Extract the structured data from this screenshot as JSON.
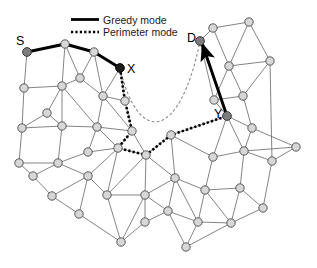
{
  "figure": {
    "background": "#ffffff"
  },
  "legend": {
    "position": "top-center",
    "items": [
      {
        "label": "Greedy mode",
        "style": "solid",
        "swatch": "greedy-line-swatch",
        "color": "#000000",
        "width": 2.8
      },
      {
        "label": "Perimeter mode",
        "style": "dotted",
        "swatch": "perimeter-line-swatch",
        "color": "#000000",
        "width": 2.6
      }
    ]
  },
  "labels": {
    "source": "S",
    "destination": "D",
    "perimeter_entry": "X",
    "perimeter_exit": "Y"
  },
  "colors": {
    "node_fill": "#d7d7d7",
    "node_stroke": "#4a4a4a",
    "marked_node_fill": "#7d7d7d",
    "dark_node_fill": "#1c1c1c",
    "edge": "#6e6e6e",
    "greedy": "#000000",
    "perimeter": "#000000",
    "xd_line": "#8a8a8a"
  },
  "graph": {
    "node_radius": 4.2,
    "marked_node_radius": 4.4,
    "nodes": [
      {
        "id": "n0",
        "x": 27,
        "y": 52,
        "role": "source",
        "label": "S"
      },
      {
        "id": "n1",
        "x": 65,
        "y": 44,
        "role": "plain"
      },
      {
        "id": "n2",
        "x": 94,
        "y": 52,
        "role": "plain"
      },
      {
        "id": "n3",
        "x": 120,
        "y": 68,
        "role": "perimeter-entry",
        "label": "X"
      },
      {
        "id": "n4",
        "x": 200,
        "y": 41,
        "role": "destination",
        "label": "D"
      },
      {
        "id": "n5",
        "x": 227,
        "y": 116,
        "role": "perimeter-exit",
        "label": "Y"
      },
      {
        "id": "n6",
        "x": 24,
        "y": 88,
        "role": "plain"
      },
      {
        "id": "n7",
        "x": 62,
        "y": 86,
        "role": "plain"
      },
      {
        "id": "n8",
        "x": 80,
        "y": 78,
        "role": "plain"
      },
      {
        "id": "n9",
        "x": 103,
        "y": 96,
        "role": "plain"
      },
      {
        "id": "n10",
        "x": 125,
        "y": 101,
        "role": "plain"
      },
      {
        "id": "n11",
        "x": 47,
        "y": 113,
        "role": "plain"
      },
      {
        "id": "n12",
        "x": 22,
        "y": 128,
        "role": "plain"
      },
      {
        "id": "n13",
        "x": 62,
        "y": 126,
        "role": "plain"
      },
      {
        "id": "n14",
        "x": 97,
        "y": 127,
        "role": "plain"
      },
      {
        "id": "n15",
        "x": 132,
        "y": 131,
        "role": "plain"
      },
      {
        "id": "n16",
        "x": 19,
        "y": 163,
        "role": "plain"
      },
      {
        "id": "n17",
        "x": 58,
        "y": 163,
        "role": "plain"
      },
      {
        "id": "n18",
        "x": 88,
        "y": 152,
        "role": "plain"
      },
      {
        "id": "n19",
        "x": 118,
        "y": 148,
        "role": "plain"
      },
      {
        "id": "n20",
        "x": 146,
        "y": 155,
        "role": "plain"
      },
      {
        "id": "n21",
        "x": 33,
        "y": 176,
        "role": "plain"
      },
      {
        "id": "n22",
        "x": 52,
        "y": 196,
        "role": "plain"
      },
      {
        "id": "n23",
        "x": 88,
        "y": 176,
        "role": "plain"
      },
      {
        "id": "n24",
        "x": 79,
        "y": 214,
        "role": "plain"
      },
      {
        "id": "n25",
        "x": 107,
        "y": 195,
        "role": "plain"
      },
      {
        "id": "n26",
        "x": 145,
        "y": 195,
        "role": "plain"
      },
      {
        "id": "n27",
        "x": 121,
        "y": 242,
        "role": "plain"
      },
      {
        "id": "n28",
        "x": 145,
        "y": 222,
        "role": "plain"
      },
      {
        "id": "n29",
        "x": 171,
        "y": 135,
        "role": "plain"
      },
      {
        "id": "n30",
        "x": 175,
        "y": 178,
        "role": "plain"
      },
      {
        "id": "n31",
        "x": 168,
        "y": 211,
        "role": "plain"
      },
      {
        "id": "n32",
        "x": 186,
        "y": 247,
        "role": "plain"
      },
      {
        "id": "n33",
        "x": 198,
        "y": 222,
        "role": "plain"
      },
      {
        "id": "n34",
        "x": 205,
        "y": 190,
        "role": "plain"
      },
      {
        "id": "n35",
        "x": 213,
        "y": 157,
        "role": "plain"
      },
      {
        "id": "n36",
        "x": 231,
        "y": 223,
        "role": "plain"
      },
      {
        "id": "n37",
        "x": 240,
        "y": 188,
        "role": "plain"
      },
      {
        "id": "n38",
        "x": 244,
        "y": 151,
        "role": "plain"
      },
      {
        "id": "n39",
        "x": 263,
        "y": 208,
        "role": "plain"
      },
      {
        "id": "n40",
        "x": 272,
        "y": 161,
        "role": "plain"
      },
      {
        "id": "n41",
        "x": 252,
        "y": 128,
        "role": "plain"
      },
      {
        "id": "n42",
        "x": 243,
        "y": 96,
        "role": "plain"
      },
      {
        "id": "n43",
        "x": 214,
        "y": 100,
        "role": "plain"
      },
      {
        "id": "n44",
        "x": 229,
        "y": 66,
        "role": "plain"
      },
      {
        "id": "n45",
        "x": 213,
        "y": 28,
        "role": "plain"
      },
      {
        "id": "n46",
        "x": 249,
        "y": 22,
        "role": "plain"
      },
      {
        "id": "n47",
        "x": 270,
        "y": 61,
        "role": "plain"
      },
      {
        "id": "n48",
        "x": 296,
        "y": 147,
        "role": "plain"
      }
    ],
    "edges": [
      [
        "n0",
        "n1"
      ],
      [
        "n1",
        "n2"
      ],
      [
        "n2",
        "n3"
      ],
      [
        "n0",
        "n6"
      ],
      [
        "n1",
        "n8"
      ],
      [
        "n1",
        "n7"
      ],
      [
        "n2",
        "n8"
      ],
      [
        "n2",
        "n9"
      ],
      [
        "n3",
        "n9"
      ],
      [
        "n3",
        "n10"
      ],
      [
        "n6",
        "n7"
      ],
      [
        "n7",
        "n8"
      ],
      [
        "n8",
        "n9"
      ],
      [
        "n9",
        "n10"
      ],
      [
        "n6",
        "n12"
      ],
      [
        "n7",
        "n11"
      ],
      [
        "n7",
        "n13"
      ],
      [
        "n7",
        "n14"
      ],
      [
        "n9",
        "n14"
      ],
      [
        "n9",
        "n15"
      ],
      [
        "n10",
        "n15"
      ],
      [
        "n11",
        "n12"
      ],
      [
        "n11",
        "n13"
      ],
      [
        "n12",
        "n13"
      ],
      [
        "n13",
        "n14"
      ],
      [
        "n14",
        "n15"
      ],
      [
        "n12",
        "n16"
      ],
      [
        "n13",
        "n17"
      ],
      [
        "n14",
        "n18"
      ],
      [
        "n14",
        "n19"
      ],
      [
        "n15",
        "n19"
      ],
      [
        "n15",
        "n20"
      ],
      [
        "n16",
        "n17"
      ],
      [
        "n16",
        "n21"
      ],
      [
        "n17",
        "n18"
      ],
      [
        "n17",
        "n21"
      ],
      [
        "n17",
        "n23"
      ],
      [
        "n18",
        "n19"
      ],
      [
        "n19",
        "n20"
      ],
      [
        "n19",
        "n23"
      ],
      [
        "n21",
        "n22"
      ],
      [
        "n22",
        "n23"
      ],
      [
        "n22",
        "n24"
      ],
      [
        "n23",
        "n24"
      ],
      [
        "n23",
        "n25"
      ],
      [
        "n19",
        "n25"
      ],
      [
        "n20",
        "n25"
      ],
      [
        "n20",
        "n26"
      ],
      [
        "n25",
        "n26"
      ],
      [
        "n25",
        "n27"
      ],
      [
        "n24",
        "n27"
      ],
      [
        "n26",
        "n27"
      ],
      [
        "n26",
        "n28"
      ],
      [
        "n27",
        "n28"
      ],
      [
        "n20",
        "n29"
      ],
      [
        "n20",
        "n30"
      ],
      [
        "n26",
        "n30"
      ],
      [
        "n26",
        "n31"
      ],
      [
        "n28",
        "n31"
      ],
      [
        "n29",
        "n30"
      ],
      [
        "n29",
        "n35"
      ],
      [
        "n30",
        "n31"
      ],
      [
        "n30",
        "n34"
      ],
      [
        "n30",
        "n33"
      ],
      [
        "n31",
        "n32"
      ],
      [
        "n31",
        "n33"
      ],
      [
        "n32",
        "n33"
      ],
      [
        "n32",
        "n36"
      ],
      [
        "n33",
        "n34"
      ],
      [
        "n33",
        "n36"
      ],
      [
        "n34",
        "n35"
      ],
      [
        "n34",
        "n37"
      ],
      [
        "n34",
        "n36"
      ],
      [
        "n35",
        "n38"
      ],
      [
        "n36",
        "n37"
      ],
      [
        "n36",
        "n39"
      ],
      [
        "n37",
        "n38"
      ],
      [
        "n37",
        "n39"
      ],
      [
        "n38",
        "n40"
      ],
      [
        "n38",
        "n48"
      ],
      [
        "n39",
        "n40"
      ],
      [
        "n40",
        "n48"
      ],
      [
        "n29",
        "n5"
      ],
      [
        "n5",
        "n35"
      ],
      [
        "n5",
        "n38"
      ],
      [
        "n5",
        "n41"
      ],
      [
        "n41",
        "n38"
      ],
      [
        "n41",
        "n42"
      ],
      [
        "n41",
        "n48"
      ],
      [
        "n42",
        "n43"
      ],
      [
        "n42",
        "n47"
      ],
      [
        "n43",
        "n44"
      ],
      [
        "n43",
        "n5"
      ],
      [
        "n44",
        "n45"
      ],
      [
        "n44",
        "n46"
      ],
      [
        "n44",
        "n47"
      ],
      [
        "n45",
        "n46"
      ],
      [
        "n4",
        "n45"
      ],
      [
        "n4",
        "n43"
      ],
      [
        "n4",
        "n5"
      ],
      [
        "n42",
        "n44"
      ],
      [
        "n46",
        "n47"
      ],
      [
        "n47",
        "n40"
      ]
    ],
    "greedy_path_1": [
      "n0",
      "n1",
      "n2",
      "n3"
    ],
    "greedy_path_2": [
      "n5",
      "n4"
    ],
    "perimeter_path": [
      "n3",
      "n10",
      "n15",
      "n19",
      "n20",
      "n29",
      "n5"
    ],
    "xd_reference_line": {
      "from": "n3",
      "to": "n4",
      "style": "fine-dashed",
      "description": "straight line from X to D used for perimeter face traversal"
    },
    "arrow": {
      "from": "n5",
      "to": "n4",
      "description": "greedy forwarding arrow into destination D"
    }
  }
}
